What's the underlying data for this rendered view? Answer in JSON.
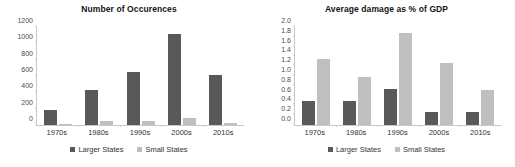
{
  "charts": [
    {
      "title": "Number of Occurences",
      "legend": [
        {
          "label": "Larger States",
          "color": "#595959"
        },
        {
          "label": "Small States",
          "color": "#bfbfbf"
        }
      ]
    },
    {
      "title": "Average damage as % of GDP",
      "legend": [
        {
          "label": "Larger States",
          "color": "#595959"
        },
        {
          "label": "Small States",
          "color": "#bfbfbf"
        }
      ]
    }
  ],
  "chart_data": [
    {
      "type": "bar",
      "title": "Number of Occurences",
      "xlabel": "",
      "ylabel": "",
      "categories": [
        "1970s",
        "1980s",
        "1990s",
        "2000s",
        "2010s"
      ],
      "series": [
        {
          "name": "Larger States",
          "color": "#595959",
          "values": [
            180,
            425,
            650,
            1110,
            615
          ]
        },
        {
          "name": "Small States",
          "color": "#bfbfbf",
          "values": [
            10,
            45,
            45,
            85,
            25
          ]
        }
      ],
      "ylim": [
        0,
        1200
      ],
      "yticks": [
        0,
        200,
        400,
        600,
        800,
        1000,
        1200
      ],
      "ytick_labels": [
        "0",
        "200",
        "400",
        "600",
        "800",
        "1000",
        "1200"
      ],
      "grid": false,
      "legend_position": "bottom"
    },
    {
      "type": "bar",
      "title": "Average damage as % of GDP",
      "xlabel": "",
      "ylabel": "",
      "categories": [
        "1970s",
        "1980s",
        "1990s",
        "2000s",
        "2010s"
      ],
      "series": [
        {
          "name": "Larger States",
          "color": "#595959",
          "values": [
            0.48,
            0.49,
            0.73,
            0.27,
            0.26
          ]
        },
        {
          "name": "Small States",
          "color": "#bfbfbf",
          "values": [
            1.35,
            0.99,
            1.88,
            1.26,
            0.72
          ]
        }
      ],
      "ylim": [
        0,
        2.0
      ],
      "yticks": [
        0.0,
        0.2,
        0.4,
        0.6,
        0.8,
        1.0,
        1.2,
        1.4,
        1.6,
        1.8,
        2.0
      ],
      "ytick_labels": [
        "0.0",
        "0.2",
        "0.4",
        "0.6",
        "0.8",
        "1.0",
        "1.2",
        "1.4",
        "1.6",
        "1.8",
        "2.0"
      ],
      "grid": false,
      "legend_position": "bottom"
    }
  ]
}
